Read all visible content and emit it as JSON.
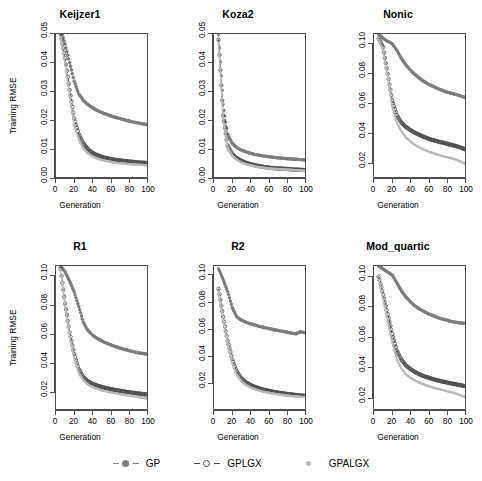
{
  "figure": {
    "axis_titles": {
      "x": "Generation",
      "y": "Training RMSE"
    },
    "legend": {
      "items": [
        {
          "label": "GP",
          "style": "dashed-filled-circle",
          "color": "#7d7d7d"
        },
        {
          "label": "GPLGX",
          "style": "dashed-open-circle",
          "color": "#4a4a4a"
        },
        {
          "label": "GPALGX",
          "style": "dotted-small",
          "color": "#b9b9b9"
        }
      ]
    }
  },
  "chart_data": [
    {
      "type": "line",
      "title": "Keijzer1",
      "xlabel": "Generation",
      "ylabel": "Training RMSE",
      "xlim": [
        0,
        100
      ],
      "ylim": [
        0.0,
        0.05
      ],
      "xticks": [
        0,
        20,
        40,
        60,
        80,
        100
      ],
      "yticks": [
        "0.00",
        "0.01",
        "0.02",
        "0.03",
        "0.04",
        "0.05"
      ],
      "grid": false,
      "legend_position": "bottom",
      "x": [
        5,
        10,
        15,
        20,
        25,
        30,
        35,
        40,
        45,
        50,
        55,
        60,
        65,
        70,
        75,
        80,
        85,
        90,
        95,
        100
      ],
      "series": [
        {
          "name": "GP",
          "color": "#7d7d7d",
          "values": [
            0.052,
            0.0465,
            0.04,
            0.0335,
            0.029,
            0.0268,
            0.0253,
            0.0242,
            0.0233,
            0.0226,
            0.022,
            0.0214,
            0.0209,
            0.0205,
            0.02,
            0.0196,
            0.0192,
            0.0189,
            0.0186,
            0.0183
          ]
        },
        {
          "name": "GPLGX",
          "color": "#4a4a4a",
          "values": [
            0.05,
            0.0415,
            0.0305,
            0.0205,
            0.015,
            0.0118,
            0.0098,
            0.0085,
            0.0077,
            0.0071,
            0.0066,
            0.0063,
            0.006,
            0.0058,
            0.0056,
            0.0054,
            0.0053,
            0.0051,
            0.005,
            0.0049
          ]
        },
        {
          "name": "GPALGX",
          "color": "#b9b9b9",
          "values": [
            0.049,
            0.0395,
            0.028,
            0.0182,
            0.013,
            0.01,
            0.0083,
            0.0072,
            0.0065,
            0.006,
            0.0056,
            0.0053,
            0.005,
            0.0048,
            0.0047,
            0.0045,
            0.0044,
            0.0043,
            0.0042,
            0.0041
          ]
        }
      ]
    },
    {
      "type": "line",
      "title": "Koza2",
      "xlabel": "Generation",
      "ylabel": "",
      "xlim": [
        0,
        100
      ],
      "ylim": [
        0.0,
        0.05
      ],
      "xticks": [
        0,
        20,
        40,
        60,
        80,
        100
      ],
      "yticks": [
        "0.00",
        "0.01",
        "0.02",
        "0.03",
        "0.04",
        "0.05"
      ],
      "grid": false,
      "legend_position": "bottom",
      "x": [
        5,
        10,
        15,
        20,
        25,
        30,
        35,
        40,
        45,
        50,
        55,
        60,
        65,
        70,
        75,
        80,
        85,
        90,
        95,
        100
      ],
      "series": [
        {
          "name": "GP",
          "color": "#7d7d7d",
          "values": [
            0.05,
            0.0255,
            0.015,
            0.0118,
            0.0103,
            0.0094,
            0.0088,
            0.0083,
            0.0079,
            0.0076,
            0.0073,
            0.0071,
            0.0069,
            0.0067,
            0.0066,
            0.0064,
            0.0063,
            0.0062,
            0.0061,
            0.006
          ]
        },
        {
          "name": "GPLGX",
          "color": "#4a4a4a",
          "values": [
            0.048,
            0.0215,
            0.011,
            0.008,
            0.0066,
            0.0057,
            0.005,
            0.0045,
            0.0041,
            0.0038,
            0.0035,
            0.0033,
            0.0031,
            0.003,
            0.0029,
            0.0028,
            0.0027,
            0.0026,
            0.0025,
            0.0024
          ]
        },
        {
          "name": "GPALGX",
          "color": "#b9b9b9",
          "values": [
            0.047,
            0.0205,
            0.0102,
            0.0074,
            0.006,
            0.0051,
            0.0045,
            0.0041,
            0.0037,
            0.0034,
            0.0032,
            0.003,
            0.0029,
            0.0028,
            0.0027,
            0.0026,
            0.0025,
            0.0024,
            0.0023,
            0.0022
          ]
        }
      ]
    },
    {
      "type": "line",
      "title": "Nonic",
      "xlabel": "Generation",
      "ylabel": "",
      "xlim": [
        0,
        100
      ],
      "ylim": [
        0.01,
        0.107
      ],
      "xticks": [
        0,
        20,
        40,
        60,
        80,
        100
      ],
      "yticks": [
        "0.02",
        "0.04",
        "0.06",
        "0.08",
        "0.10"
      ],
      "grid": false,
      "legend_position": "bottom",
      "x": [
        5,
        10,
        15,
        20,
        25,
        30,
        35,
        40,
        45,
        50,
        55,
        60,
        65,
        70,
        75,
        80,
        85,
        90,
        95,
        100
      ],
      "series": [
        {
          "name": "GP",
          "color": "#7d7d7d",
          "values": [
            0.107,
            0.104,
            0.102,
            0.1005,
            0.096,
            0.0905,
            0.086,
            0.0825,
            0.0795,
            0.077,
            0.0748,
            0.073,
            0.0715,
            0.07,
            0.0688,
            0.0676,
            0.0668,
            0.066,
            0.065,
            0.0638
          ]
        },
        {
          "name": "GPLGX",
          "color": "#4a4a4a",
          "values": [
            0.104,
            0.098,
            0.08,
            0.062,
            0.052,
            0.047,
            0.044,
            0.0418,
            0.04,
            0.0385,
            0.0372,
            0.036,
            0.035,
            0.0341,
            0.0334,
            0.0326,
            0.0318,
            0.031,
            0.03,
            0.0288
          ]
        },
        {
          "name": "GPALGX",
          "color": "#b9b9b9",
          "values": [
            0.103,
            0.096,
            0.077,
            0.058,
            0.047,
            0.041,
            0.037,
            0.034,
            0.0318,
            0.03,
            0.0285,
            0.0272,
            0.0262,
            0.0252,
            0.0243,
            0.0235,
            0.0227,
            0.0218,
            0.0205,
            0.019
          ]
        }
      ]
    },
    {
      "type": "line",
      "title": "R1",
      "xlabel": "Generation",
      "ylabel": "Training RMSE",
      "xlim": [
        0,
        100
      ],
      "ylim": [
        0.008,
        0.107
      ],
      "xticks": [
        0,
        20,
        40,
        60,
        80,
        100
      ],
      "yticks": [
        "0.02",
        "0.04",
        "0.06",
        "0.08",
        "0.10"
      ],
      "grid": false,
      "legend_position": "bottom",
      "x": [
        5,
        10,
        15,
        20,
        25,
        30,
        35,
        40,
        45,
        50,
        55,
        60,
        65,
        70,
        75,
        80,
        85,
        90,
        95,
        100
      ],
      "series": [
        {
          "name": "GP",
          "color": "#7d7d7d",
          "values": [
            0.107,
            0.103,
            0.0965,
            0.089,
            0.079,
            0.068,
            0.0625,
            0.0592,
            0.057,
            0.0552,
            0.0537,
            0.0525,
            0.0513,
            0.0503,
            0.0493,
            0.0485,
            0.0477,
            0.047,
            0.0465,
            0.046
          ]
        },
        {
          "name": "GPLGX",
          "color": "#4a4a4a",
          "values": [
            0.105,
            0.081,
            0.061,
            0.046,
            0.0355,
            0.03,
            0.0272,
            0.0255,
            0.0243,
            0.0233,
            0.0225,
            0.0218,
            0.0212,
            0.0206,
            0.0201,
            0.0196,
            0.0192,
            0.0188,
            0.0184,
            0.018
          ]
        },
        {
          "name": "GPALGX",
          "color": "#b9b9b9",
          "values": [
            0.104,
            0.079,
            0.058,
            0.043,
            0.033,
            0.0278,
            0.025,
            0.0232,
            0.022,
            0.021,
            0.0202,
            0.0195,
            0.0189,
            0.0183,
            0.0178,
            0.0173,
            0.0168,
            0.0163,
            0.0158,
            0.0152
          ]
        }
      ]
    },
    {
      "type": "line",
      "title": "R2",
      "xlabel": "Generation",
      "ylabel": "",
      "xlim": [
        0,
        100
      ],
      "ylim": [
        0.0,
        0.107
      ],
      "xticks": [
        0,
        20,
        40,
        60,
        80,
        100
      ],
      "yticks": [
        "0.02",
        "0.04",
        "0.06",
        "0.08",
        "0.10"
      ],
      "grid": false,
      "legend_position": "bottom",
      "x": [
        5,
        10,
        15,
        20,
        25,
        30,
        35,
        40,
        45,
        50,
        55,
        60,
        65,
        70,
        75,
        80,
        85,
        90,
        95,
        100
      ],
      "series": [
        {
          "name": "GP",
          "color": "#7d7d7d",
          "values": [
            0.105,
            0.097,
            0.088,
            0.076,
            0.069,
            0.0665,
            0.065,
            0.0638,
            0.0628,
            0.0618,
            0.061,
            0.0602,
            0.0595,
            0.0588,
            0.0582,
            0.0575,
            0.0568,
            0.0562,
            0.0578,
            0.057
          ]
        },
        {
          "name": "GPLGX",
          "color": "#4a4a4a",
          "values": [
            0.09,
            0.069,
            0.051,
            0.037,
            0.028,
            0.023,
            0.02,
            0.018,
            0.0165,
            0.0153,
            0.0144,
            0.0136,
            0.0129,
            0.0123,
            0.0118,
            0.0113,
            0.0109,
            0.0105,
            0.0101,
            0.0098
          ]
        },
        {
          "name": "GPALGX",
          "color": "#b9b9b9",
          "values": [
            0.088,
            0.0665,
            0.0485,
            0.0345,
            0.0255,
            0.0208,
            0.018,
            0.0162,
            0.0148,
            0.0137,
            0.0128,
            0.0121,
            0.0115,
            0.011,
            0.0105,
            0.0101,
            0.0097,
            0.0094,
            0.0091,
            0.0089
          ]
        }
      ]
    },
    {
      "type": "line",
      "title": "Mod_quartic",
      "xlabel": "Generation",
      "ylabel": "",
      "xlim": [
        0,
        100
      ],
      "ylim": [
        0.012,
        0.107
      ],
      "xticks": [
        0,
        20,
        40,
        60,
        80,
        100
      ],
      "yticks": [
        "0.02",
        "0.04",
        "0.06",
        "0.08",
        "0.10"
      ],
      "grid": false,
      "legend_position": "bottom",
      "x": [
        5,
        10,
        15,
        20,
        25,
        30,
        35,
        40,
        45,
        50,
        55,
        60,
        65,
        70,
        75,
        80,
        85,
        90,
        95,
        100
      ],
      "series": [
        {
          "name": "GP",
          "color": "#7d7d7d",
          "values": [
            0.107,
            0.105,
            0.103,
            0.101,
            0.096,
            0.0905,
            0.0865,
            0.0832,
            0.0805,
            0.0785,
            0.0768,
            0.0752,
            0.074,
            0.0728,
            0.0718,
            0.071,
            0.0702,
            0.0696,
            0.0692,
            0.0688
          ]
        },
        {
          "name": "GPLGX",
          "color": "#4a4a4a",
          "values": [
            0.1,
            0.088,
            0.075,
            0.062,
            0.051,
            0.0448,
            0.041,
            0.0385,
            0.0366,
            0.035,
            0.0338,
            0.0328,
            0.0318,
            0.031,
            0.0303,
            0.0296,
            0.029,
            0.0284,
            0.0278,
            0.0272
          ]
        },
        {
          "name": "GPALGX",
          "color": "#b9b9b9",
          "values": [
            0.098,
            0.085,
            0.07,
            0.056,
            0.045,
            0.039,
            0.0352,
            0.0328,
            0.031,
            0.0295,
            0.0283,
            0.0272,
            0.0263,
            0.0255,
            0.0247,
            0.0239,
            0.0231,
            0.0222,
            0.0212,
            0.0202
          ]
        }
      ]
    }
  ]
}
